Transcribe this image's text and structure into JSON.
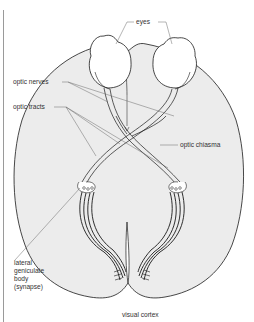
{
  "figure": {
    "labels": {
      "eyes": "eyes",
      "optic_nerves": "optic nerves",
      "optic_tracts": "optic tracts",
      "optic_chiasma": "optic chiasma",
      "lateral_geniculate": [
        "lateral",
        "geniculate",
        "body",
        "(synapse)"
      ],
      "visual_cortex": "visual cortex"
    },
    "colors": {
      "brain_fill": "#ececec",
      "outline": "#1a1a1a",
      "leader_line": "#555555",
      "eye_fill": "#ffffff"
    }
  }
}
